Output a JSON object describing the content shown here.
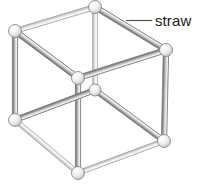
{
  "figure": {
    "name": "straw-cube-model",
    "background_color": "#ffffff",
    "width": 198,
    "height": 186
  },
  "callout": {
    "label": "straw",
    "text_color": "#1b1b1b",
    "text_x": 155,
    "text_y": 13,
    "font_size": 15,
    "leader_line": {
      "name": "leader-line",
      "color": "#555555",
      "width": 1.2,
      "x1": 126,
      "y1": 20.5,
      "x2": 152,
      "y2": 20.5
    }
  },
  "colors": {
    "straw_front_light": "#f2f2f2",
    "straw_front_mid": "#b8b8b8",
    "straw_front_dark": "#6e6e6e",
    "straw_back_light": "#fbfbfb",
    "straw_back_mid": "#dcdcdc",
    "straw_back_dark": "#a9a9a9",
    "ball_fill_light": "#ffffff",
    "ball_fill_mid": "#d8d8d8",
    "ball_stroke": "#8a8a8a",
    "outline": "#7a7a7a"
  },
  "geometry": {
    "vertices": [
      {
        "id": "top-back",
        "name": "ball-connector-top-back",
        "x": 95,
        "y": 7,
        "r": 6.5,
        "depth": "back"
      },
      {
        "id": "left-top-front",
        "name": "ball-connector-left-top-front",
        "x": 15,
        "y": 31,
        "r": 6.5,
        "depth": "front"
      },
      {
        "id": "right-top-front",
        "name": "ball-connector-right-top-front",
        "x": 166,
        "y": 50,
        "r": 6.5,
        "depth": "front"
      },
      {
        "id": "mid-upper-front",
        "name": "ball-connector-mid-upper-front",
        "x": 78,
        "y": 78,
        "r": 6.5,
        "depth": "front"
      },
      {
        "id": "mid-center-back",
        "name": "ball-connector-mid-center-back",
        "x": 95,
        "y": 90,
        "r": 6.0,
        "depth": "back"
      },
      {
        "id": "left-bottom-front",
        "name": "ball-connector-left-bottom-front",
        "x": 15,
        "y": 120,
        "r": 6.5,
        "depth": "front"
      },
      {
        "id": "right-bottom-front",
        "name": "ball-connector-right-bottom-front",
        "x": 164,
        "y": 141,
        "r": 6.5,
        "depth": "front"
      },
      {
        "id": "bottom-front",
        "name": "ball-connector-bottom-front",
        "x": 78,
        "y": 173,
        "r": 6.5,
        "depth": "front"
      }
    ],
    "edges": [
      {
        "id": "e1",
        "name": "straw-top-back-to-left-top",
        "from": "top-back",
        "to": "left-top-front",
        "depth": "back",
        "thickness": 5.0
      },
      {
        "id": "e2",
        "name": "straw-top-back-to-right-top",
        "from": "top-back",
        "to": "right-top-front",
        "depth": "front",
        "thickness": 5.4
      },
      {
        "id": "e3",
        "name": "straw-top-back-vertical",
        "from": "top-back",
        "to": "mid-center-back",
        "depth": "back",
        "thickness": 4.6
      },
      {
        "id": "e4",
        "name": "straw-left-top-to-mid-upper",
        "from": "left-top-front",
        "to": "mid-upper-front",
        "depth": "front",
        "thickness": 5.4
      },
      {
        "id": "e5",
        "name": "straw-left-top-vertical",
        "from": "left-top-front",
        "to": "left-bottom-front",
        "depth": "front",
        "thickness": 5.4
      },
      {
        "id": "e6",
        "name": "straw-right-top-to-mid-upper",
        "from": "right-top-front",
        "to": "mid-upper-front",
        "depth": "front",
        "thickness": 5.4
      },
      {
        "id": "e7",
        "name": "straw-right-top-vertical",
        "from": "right-top-front",
        "to": "right-bottom-front",
        "depth": "front",
        "thickness": 5.4
      },
      {
        "id": "e8",
        "name": "straw-mid-upper-vertical",
        "from": "mid-upper-front",
        "to": "bottom-front",
        "depth": "front",
        "thickness": 5.4
      },
      {
        "id": "e9",
        "name": "straw-mid-center-to-left-bottom",
        "from": "mid-center-back",
        "to": "left-bottom-front",
        "depth": "front",
        "thickness": 5.2
      },
      {
        "id": "e10",
        "name": "straw-mid-center-to-right-bottom",
        "from": "mid-center-back",
        "to": "right-bottom-front",
        "depth": "front",
        "thickness": 5.2
      },
      {
        "id": "e11",
        "name": "straw-left-bottom-to-bottom",
        "from": "left-bottom-front",
        "to": "bottom-front",
        "depth": "back",
        "thickness": 4.6
      },
      {
        "id": "e12",
        "name": "straw-right-bottom-to-bottom",
        "from": "right-bottom-front",
        "to": "bottom-front",
        "depth": "back",
        "thickness": 4.6
      }
    ]
  }
}
